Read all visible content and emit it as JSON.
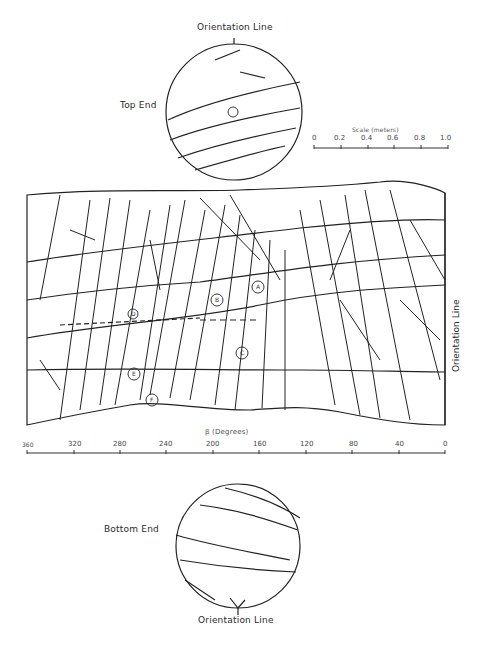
{
  "figure": {
    "top_core": {
      "orientation_label": "Orientation Line",
      "end_label": "Top End"
    },
    "bottom_core": {
      "orientation_label": "Orientation Line",
      "end_label": "Bottom End"
    },
    "scale": {
      "title": "Scale (meters)",
      "ticks": [
        "0",
        "0.2",
        "0.4",
        "0.6",
        "0.8",
        "1.0"
      ]
    },
    "unrolled_panel": {
      "right_label": "Orientation Line",
      "axis_title": "β (Degrees)",
      "axis_ticks": [
        "360",
        "320",
        "280",
        "240",
        "200",
        "160",
        "120",
        "80",
        "40",
        "0"
      ],
      "zone_labels": [
        "A",
        "B",
        "C",
        "D",
        "E",
        "F"
      ]
    }
  }
}
